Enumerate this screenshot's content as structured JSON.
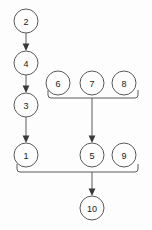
{
  "diagram": {
    "type": "directed-graph",
    "title": "",
    "background_color": "#fdfdfd",
    "node_stroke_color": "#5a5a5a",
    "node_fill_color": "#fdfdfd",
    "edge_color": "#5a5a5a",
    "arrow_color": "#3a3a3a",
    "node_radius": 12,
    "nodes": [
      {
        "id": "n2",
        "label": "2",
        "cx": 26,
        "cy": 21,
        "r": 12
      },
      {
        "id": "n4",
        "label": "4",
        "cx": 26,
        "cy": 63,
        "r": 12
      },
      {
        "id": "n3",
        "label": "3",
        "cx": 26,
        "cy": 105,
        "r": 12
      },
      {
        "id": "n1",
        "label": "1",
        "cx": 26,
        "cy": 155,
        "r": 12
      },
      {
        "id": "n6",
        "label": "6",
        "cx": 58,
        "cy": 83,
        "r": 12
      },
      {
        "id": "n7",
        "label": "7",
        "cx": 92,
        "cy": 83,
        "r": 12
      },
      {
        "id": "n8",
        "label": "8",
        "cx": 124,
        "cy": 83,
        "r": 12
      },
      {
        "id": "n5",
        "label": "5",
        "cx": 92,
        "cy": 155,
        "r": 12
      },
      {
        "id": "n9",
        "label": "9",
        "cx": 124,
        "cy": 155,
        "r": 12
      },
      {
        "id": "n10",
        "label": "10",
        "cx": 92,
        "cy": 208,
        "r": 12
      }
    ],
    "edges": [
      {
        "id": "e-2-4",
        "from": "2",
        "to": "4",
        "kind": "arrow"
      },
      {
        "id": "e-4-3",
        "from": "4",
        "to": "3",
        "kind": "arrow"
      },
      {
        "id": "e-3-1",
        "from": "3",
        "to": "1",
        "kind": "arrow"
      },
      {
        "id": "e-678-5",
        "from": "6,7,8",
        "to": "5",
        "kind": "bracket-arrow"
      },
      {
        "id": "e-159-10",
        "from": "1,5,9",
        "to": "10",
        "kind": "bracket-arrow"
      }
    ],
    "brackets": [
      {
        "id": "bracket-top",
        "x_left": 48,
        "x_right": 138,
        "y": 98,
        "members": [
          "6",
          "7",
          "8"
        ],
        "stem_x": 92,
        "stem_to_y": 141
      },
      {
        "id": "bracket-bottom",
        "x_left": 17,
        "x_right": 138,
        "y": 172,
        "members": [
          "1",
          "5",
          "9"
        ],
        "stem_x": 92,
        "stem_to_y": 194
      }
    ]
  }
}
